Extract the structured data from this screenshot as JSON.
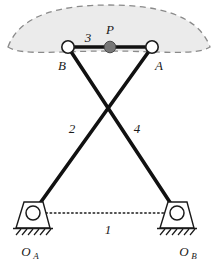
{
  "figure": {
    "background_color": "#ffffff",
    "line_color": "#111111",
    "coupler_fill": "#ebebeb",
    "coupler_stroke": "#8a8a8a",
    "point_p_fill": "#777777",
    "joint_fill": "#ffffff"
  },
  "labels": {
    "joint_b": "B",
    "joint_a": "A",
    "coupler_point": "P",
    "link_coupler": "3",
    "link_left": "2",
    "link_right": "4",
    "link_ground": "1",
    "pivot_left": "O",
    "pivot_left_sub": "A",
    "pivot_right": "O",
    "pivot_right_sub": "B"
  },
  "geometry": {
    "canvas": {
      "width": 218,
      "height": 264
    },
    "points": {
      "B": {
        "x": 68,
        "y": 47
      },
      "A": {
        "x": 152,
        "y": 47
      },
      "P": {
        "x": 110,
        "y": 47
      },
      "OA": {
        "x": 33,
        "y": 213
      },
      "OB": {
        "x": 177,
        "y": 213
      },
      "crossing": {
        "x": 113,
        "y": 103
      }
    },
    "joint_radius": 6,
    "point_p_radius": 5.5,
    "pivot_radius": 7,
    "links": [
      {
        "name": "3",
        "from": "B",
        "to": "A",
        "style": "solid-thick"
      },
      {
        "name": "2",
        "from": "OA",
        "to": "A",
        "style": "solid-thick"
      },
      {
        "name": "4",
        "from": "OB",
        "to": "B",
        "style": "solid-thick"
      },
      {
        "name": "1",
        "from": "OA",
        "to": "OB",
        "style": "dotted"
      }
    ],
    "coupler_curve": {
      "type": "closed-lens",
      "left_tip": {
        "x": 8,
        "y": 47
      },
      "right_tip": {
        "x": 210,
        "y": 47
      },
      "apex_y": 11,
      "style": "dashed"
    }
  }
}
